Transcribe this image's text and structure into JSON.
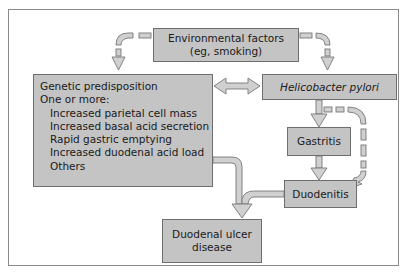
{
  "diagram": {
    "nodes": {
      "environmental": {
        "line1": "Environmental factors",
        "line2": "(eg, smoking)"
      },
      "genetic": {
        "title": "Genetic predisposition",
        "subtitle": "One or more:",
        "items": [
          "Increased parietal cell mass",
          "Increased basal acid secretion",
          "Rapid gastric emptying",
          "Increased duodenal acid load",
          "Others"
        ]
      },
      "hpylori": {
        "label": "Helicobacter pylori"
      },
      "gastritis": {
        "label": "Gastritis"
      },
      "duodenitis": {
        "label": "Duodenitis"
      },
      "ulcer": {
        "line1": "Duodenal ulcer",
        "line2": "disease"
      }
    },
    "edges": [
      {
        "from": "environmental",
        "to": "genetic",
        "style": "dashed"
      },
      {
        "from": "environmental",
        "to": "hpylori",
        "style": "dashed"
      },
      {
        "from": "genetic",
        "to": "hpylori",
        "style": "solid-bidirectional"
      },
      {
        "from": "hpylori",
        "to": "gastritis",
        "style": "solid"
      },
      {
        "from": "hpylori",
        "to": "duodenitis",
        "style": "dashed"
      },
      {
        "from": "gastritis",
        "to": "duodenitis",
        "style": "solid"
      },
      {
        "from": "genetic",
        "to": "ulcer",
        "style": "solid"
      },
      {
        "from": "duodenitis",
        "to": "ulcer",
        "style": "solid"
      }
    ],
    "colors": {
      "box_fill": "#c4c4c4",
      "box_border": "#6e6e6e",
      "arrow_fill": "#cfcfcf",
      "arrow_stroke": "#7a7a7a"
    }
  }
}
